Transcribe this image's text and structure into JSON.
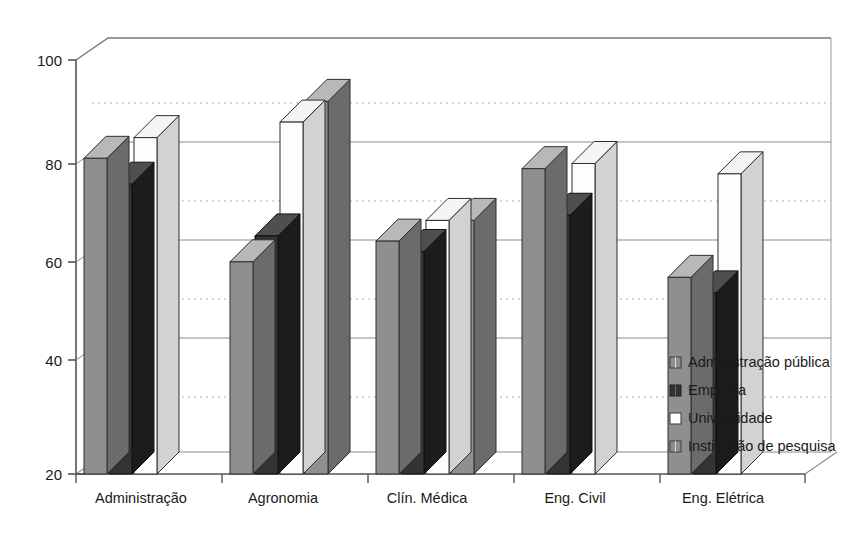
{
  "chart_data": {
    "type": "bar",
    "title": "",
    "subtitle": "",
    "xlabel": "",
    "ylabel": "",
    "ylim": [
      20,
      100
    ],
    "yticks": [
      20,
      40,
      60,
      80,
      100
    ],
    "ytick_labels": [
      "20",
      "40",
      "60",
      "80",
      "100"
    ],
    "grid": true,
    "grid_style": "horizontal solid + dotted minor",
    "legend_position": "right",
    "style": "3d-bars",
    "categories": [
      "Administração",
      "Agronomia",
      "Clín. Médica",
      "Eng. Civil",
      "Eng. Elétrica"
    ],
    "series": [
      {
        "name": "Administração pública",
        "color": "#8f8f8f",
        "values": [
          81,
          61,
          65,
          79,
          58
        ]
      },
      {
        "name": "Empresa",
        "color": "#3a3a3a",
        "values": [
          76,
          66,
          63,
          70,
          55
        ]
      },
      {
        "name": "Universidade",
        "color": "#ffffff",
        "values": [
          85,
          88,
          69,
          80,
          78
        ]
      },
      {
        "name": "Instituição de pesquisa",
        "color": "#8f8f8f",
        "values": [
          null,
          92,
          69,
          null,
          null
        ]
      }
    ]
  },
  "legend": {
    "items": [
      {
        "label": "Administração pública",
        "swatch": "#8f8f8f"
      },
      {
        "label": "Empresa",
        "swatch": "#3a3a3a"
      },
      {
        "label": "Universidade",
        "swatch": "#ffffff"
      },
      {
        "label": "Instituição de pesquisa",
        "swatch": "#8f8f8f"
      }
    ]
  },
  "axis": {
    "y_tick_0": "20",
    "y_tick_1": "40",
    "y_tick_2": "60",
    "y_tick_3": "80",
    "y_tick_4": "100",
    "x_cat_0": "Administração",
    "x_cat_1": "Agronomia",
    "x_cat_2": "Clín. Médica",
    "x_cat_3": "Eng. Civil",
    "x_cat_4": "Eng. Elétrica"
  },
  "colors": {
    "bar_gray": "#8f8f8f",
    "bar_gray_side": "#6e6e6e",
    "bar_gray_top": "#b5b5b5",
    "bar_dark": "#333333",
    "bar_dark_side": "#1f1f1f",
    "bar_dark_top": "#4d4d4d",
    "bar_white": "#fdfdfd",
    "bar_white_side": "#cccccc",
    "bar_white_top": "#f2f2f2",
    "axis": "#555555",
    "grid_solid": "#8c8c8c",
    "grid_dotted": "#b0b0b0",
    "background": "#ffffff"
  }
}
